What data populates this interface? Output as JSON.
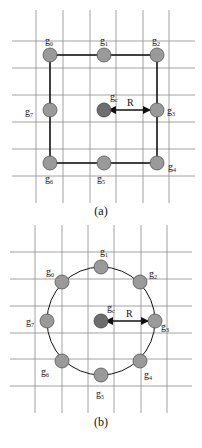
{
  "figure_a": {
    "caption": "(a)",
    "shape": "square",
    "center": {
      "label": "g",
      "sub": "c"
    },
    "radius_label": "R",
    "nodes": [
      {
        "label": "g",
        "sub": "0"
      },
      {
        "label": "g",
        "sub": "1"
      },
      {
        "label": "g",
        "sub": "2"
      },
      {
        "label": "g",
        "sub": "3"
      },
      {
        "label": "g",
        "sub": "4"
      },
      {
        "label": "g",
        "sub": "5"
      },
      {
        "label": "g",
        "sub": "6"
      },
      {
        "label": "g",
        "sub": "7"
      }
    ]
  },
  "figure_b": {
    "caption": "(b)",
    "shape": "circle",
    "center": {
      "label": "g",
      "sub": "c"
    },
    "radius_label": "R",
    "nodes": [
      {
        "label": "g",
        "sub": "0"
      },
      {
        "label": "g",
        "sub": "1"
      },
      {
        "label": "g",
        "sub": "2"
      },
      {
        "label": "g",
        "sub": "3"
      },
      {
        "label": "g",
        "sub": "4"
      },
      {
        "label": "g",
        "sub": "5"
      },
      {
        "label": "g",
        "sub": "6"
      },
      {
        "label": "g",
        "sub": "7"
      }
    ]
  }
}
